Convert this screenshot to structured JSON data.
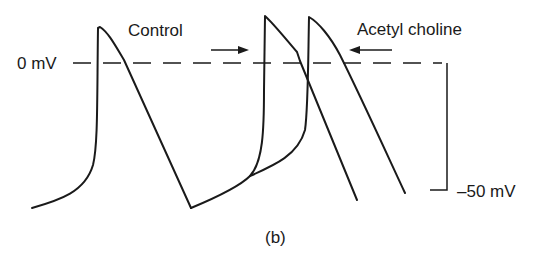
{
  "figure": {
    "panel_label": "(b)",
    "zero_line_label": "0 mV",
    "scale_label": "–50 mV",
    "annotations": {
      "control": "Control",
      "acetylcholine": "Acetyl choline"
    },
    "colors": {
      "ink": "#1a1a1a",
      "background": "#ffffff"
    },
    "traces": [
      {
        "name": "control-action-potential-1",
        "description": "First action potential (control)"
      },
      {
        "name": "control-action-potential-2",
        "description": "Second action potential (control), earlier"
      },
      {
        "name": "acetylcholine-action-potential",
        "description": "Second action potential with acetylcholine, delayed"
      }
    ]
  }
}
